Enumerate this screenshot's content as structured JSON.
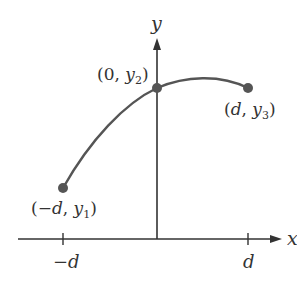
{
  "diagram": {
    "axes": {
      "x_label": "x",
      "y_label": "y",
      "ticks": [
        {
          "label_prefix": "−",
          "label_var": "d",
          "position": "-d"
        },
        {
          "label_prefix": "",
          "label_var": "d",
          "position": "d"
        }
      ]
    },
    "points": [
      {
        "name": "p1",
        "open": "(",
        "x": "−d",
        "sep": ", ",
        "y": "y",
        "sub": "1",
        "close": ")"
      },
      {
        "name": "p2",
        "open": "(",
        "x": "0",
        "sep": ", ",
        "y": "y",
        "sub": "2",
        "close": ")"
      },
      {
        "name": "p3",
        "open": "(",
        "x": "d",
        "sep": ", ",
        "y": "y",
        "sub": "3",
        "close": ")"
      }
    ],
    "colors": {
      "curve": "#555555",
      "axis": "#333333",
      "point": "#555555"
    }
  }
}
